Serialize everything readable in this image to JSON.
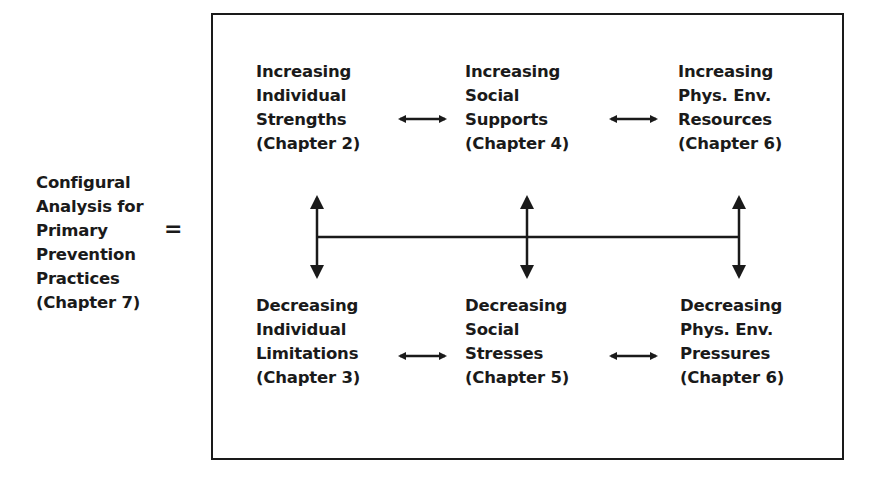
{
  "left_label": {
    "lines": [
      "Configural",
      "Analysis for",
      "Primary",
      "Prevention",
      "Practices",
      "(Chapter 7)"
    ]
  },
  "equals": "=",
  "top_row": [
    {
      "lines": [
        "Increasing",
        "Individual",
        "Strengths",
        "(Chapter 2)"
      ]
    },
    {
      "lines": [
        "Increasing",
        "Social",
        "Supports",
        "(Chapter 4)"
      ]
    },
    {
      "lines": [
        "Increasing",
        "Phys. Env.",
        "Resources",
        "(Chapter 6)"
      ]
    }
  ],
  "bottom_row": [
    {
      "lines": [
        "Decreasing",
        "Individual",
        "Limitations",
        "(Chapter 3)"
      ]
    },
    {
      "lines": [
        "Decreasing",
        "Social",
        "Stresses",
        "(Chapter 5)"
      ]
    },
    {
      "lines": [
        "Decreasing",
        "Phys. Env.",
        "Pressures",
        "(Chapter 6)"
      ]
    }
  ],
  "colors": {
    "ink": "#1a1a1a",
    "background": "#ffffff"
  }
}
